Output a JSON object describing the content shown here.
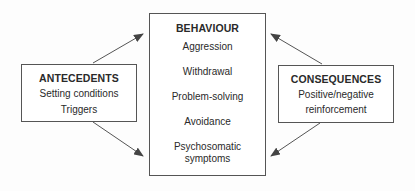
{
  "diagram": {
    "antecedents": {
      "title": "ANTECEDENTS",
      "items": [
        "Setting conditions",
        "Triggers"
      ]
    },
    "behaviour": {
      "title": "BEHAVIOUR",
      "items": [
        "Aggression",
        "Withdrawal",
        "Problem-solving",
        "Avoidance",
        "Psychosomatic symptoms"
      ]
    },
    "consequences": {
      "title": "CONSEQUENCES",
      "items": [
        "Positive/negative",
        "reinforcement"
      ]
    },
    "arrows": [
      {
        "from": "antecedents",
        "to": "behaviour-top"
      },
      {
        "from": "antecedents",
        "to": "behaviour-bottom"
      },
      {
        "from": "consequences",
        "to": "behaviour-top"
      },
      {
        "from": "consequences",
        "to": "behaviour-bottom"
      }
    ],
    "colors": {
      "line": "#555555",
      "text": "#2a2a2a",
      "background": "#fdfdfd"
    }
  }
}
